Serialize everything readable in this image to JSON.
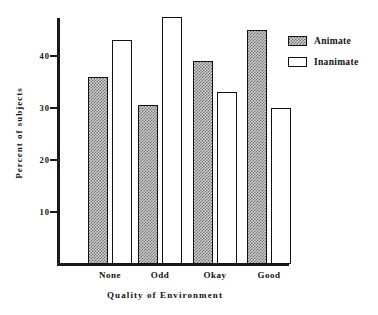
{
  "chart_data": {
    "type": "bar",
    "title": "",
    "xlabel": "Quality of Environment",
    "ylabel": "Percent of subjects",
    "categories": [
      "None",
      "Odd",
      "Okay",
      "Good"
    ],
    "series": [
      {
        "name": "Animate",
        "values": [
          36,
          30.5,
          39,
          45
        ]
      },
      {
        "name": "Inanimate",
        "values": [
          43,
          47.5,
          33,
          30
        ]
      }
    ],
    "yticks": [
      10,
      20,
      30,
      40
    ],
    "ylim": [
      0,
      48
    ],
    "grid": false,
    "legend_position": "top-right",
    "colors": {
      "animate_fill": "#cfcfcf",
      "animate_hatch": "#6e6e6e",
      "inanimate_fill": "#ffffff",
      "outline": "#111111"
    }
  },
  "legend": {
    "items": [
      {
        "label": "Animate",
        "style": "hatched"
      },
      {
        "label": "Inanimate",
        "style": "empty"
      }
    ]
  }
}
